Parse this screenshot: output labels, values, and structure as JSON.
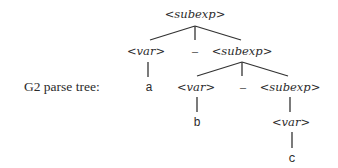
{
  "caption": "G2 parse tree:",
  "nodes": {
    "root": "<subexp>",
    "l1_var": "<var>",
    "l1_dash": "–",
    "l1_subexp": "<subexp>",
    "leaf_a": "a",
    "l2_var": "<var>",
    "l2_dash": "–",
    "l2_subexp": "<subexp>",
    "leaf_b": "b",
    "l3_var": "<var>",
    "leaf_c": "c"
  },
  "tree": {
    "label": "<subexp>",
    "children": [
      {
        "label": "<var>",
        "children": [
          {
            "label": "a"
          }
        ]
      },
      {
        "label": "–"
      },
      {
        "label": "<subexp>",
        "children": [
          {
            "label": "<var>",
            "children": [
              {
                "label": "b"
              }
            ]
          },
          {
            "label": "–"
          },
          {
            "label": "<subexp>",
            "children": [
              {
                "label": "<var>",
                "children": [
                  {
                    "label": "c"
                  }
                ]
              }
            ]
          }
        ]
      }
    ]
  }
}
